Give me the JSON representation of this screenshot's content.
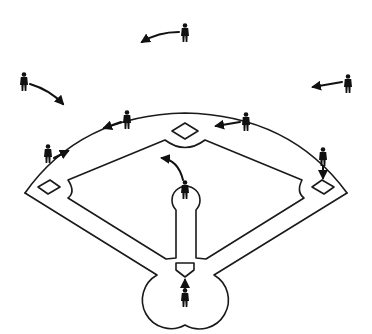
{
  "diagram": {
    "title": "Baseball defensive positions with movement arrows",
    "colors": {
      "background": "#ffffff",
      "line": "#1a1a1a",
      "player": "#111111"
    },
    "field": {
      "home_plate": "home-plate",
      "bases": [
        "first-base",
        "second-base",
        "third-base"
      ],
      "pitcher_mound": "pitchers-mound"
    },
    "players": [
      {
        "id": "catcher",
        "x": 185,
        "y": 296,
        "arrow": "up-to-home-plate"
      },
      {
        "id": "pitcher",
        "x": 185,
        "y": 190,
        "arrow": "curved-up-left"
      },
      {
        "id": "first-baseman",
        "x": 323,
        "y": 157,
        "arrow": "down-to-first-base"
      },
      {
        "id": "second-baseman",
        "x": 246,
        "y": 122,
        "arrow": "left-to-second-base"
      },
      {
        "id": "shortstop",
        "x": 127,
        "y": 118,
        "arrow": "left"
      },
      {
        "id": "third-baseman",
        "x": 48,
        "y": 152,
        "arrow": "right"
      },
      {
        "id": "left-fielder",
        "x": 24,
        "y": 82,
        "arrow": "curved-down-right"
      },
      {
        "id": "center-fielder",
        "x": 185,
        "y": 32,
        "arrow": "curved-left"
      },
      {
        "id": "right-fielder",
        "x": 348,
        "y": 83,
        "arrow": "left"
      }
    ]
  }
}
